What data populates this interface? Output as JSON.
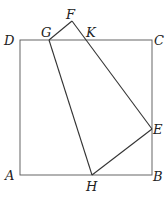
{
  "figure": {
    "type": "geometry-diagram",
    "square": {
      "vertices": [
        "A",
        "B",
        "C",
        "D"
      ]
    },
    "quadrilateral": {
      "vertices": [
        "F",
        "E",
        "H",
        "G"
      ]
    },
    "points": {
      "A": {
        "label": "A",
        "x": 20,
        "y": 175
      },
      "B": {
        "label": "B",
        "x": 152,
        "y": 175
      },
      "C": {
        "label": "C",
        "x": 152,
        "y": 40
      },
      "D": {
        "label": "D",
        "x": 20,
        "y": 40
      },
      "E": {
        "label": "E",
        "x": 152,
        "y": 129
      },
      "F": {
        "label": "F",
        "x": 72,
        "y": 21
      },
      "G": {
        "label": "G",
        "x": 49,
        "y": 40
      },
      "H": {
        "label": "H",
        "x": 92,
        "y": 175
      },
      "K": {
        "label": "K",
        "x": 84,
        "y": 40
      }
    }
  }
}
